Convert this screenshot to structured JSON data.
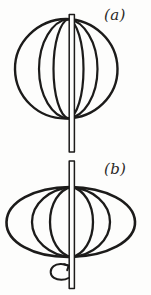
{
  "figure": {
    "background_color": "#fdfdfc",
    "ink_color": "#1c1b1a",
    "width": 151,
    "height": 295,
    "panels": [
      {
        "key": "a",
        "label": "(a)",
        "shape": "sphere",
        "description": "non-rotating spherical body drawn with outer circle and two inner meridian ellipses",
        "center_x": 66,
        "center_y": 69,
        "radius_x": 51,
        "radius_y": 50,
        "meridian_half_widths": [
          31,
          16
        ],
        "rotating": false
      },
      {
        "key": "b",
        "label": "(b)",
        "shape": "oblate-spheroid",
        "description": "rotating body flattened at the poles, drawn with outer oblate ellipse and two inner meridian ellipses",
        "center_x": 70,
        "center_y": 222,
        "radius_x": 65,
        "radius_y": 35,
        "meridian_half_widths": [
          40,
          22
        ],
        "rotating": true
      }
    ],
    "axis": {
      "name": "rotation-axis",
      "x": 72,
      "top_y": 14,
      "bottom_y": 289,
      "break_top_y": 152,
      "break_bottom_y": 161,
      "rod_half_width": 3
    },
    "rotation_arrow": {
      "label": "rotation",
      "direction": "counterclockwise",
      "center_x": 61,
      "center_y": 272,
      "radius_x": 11,
      "radius_y": 7
    }
  }
}
